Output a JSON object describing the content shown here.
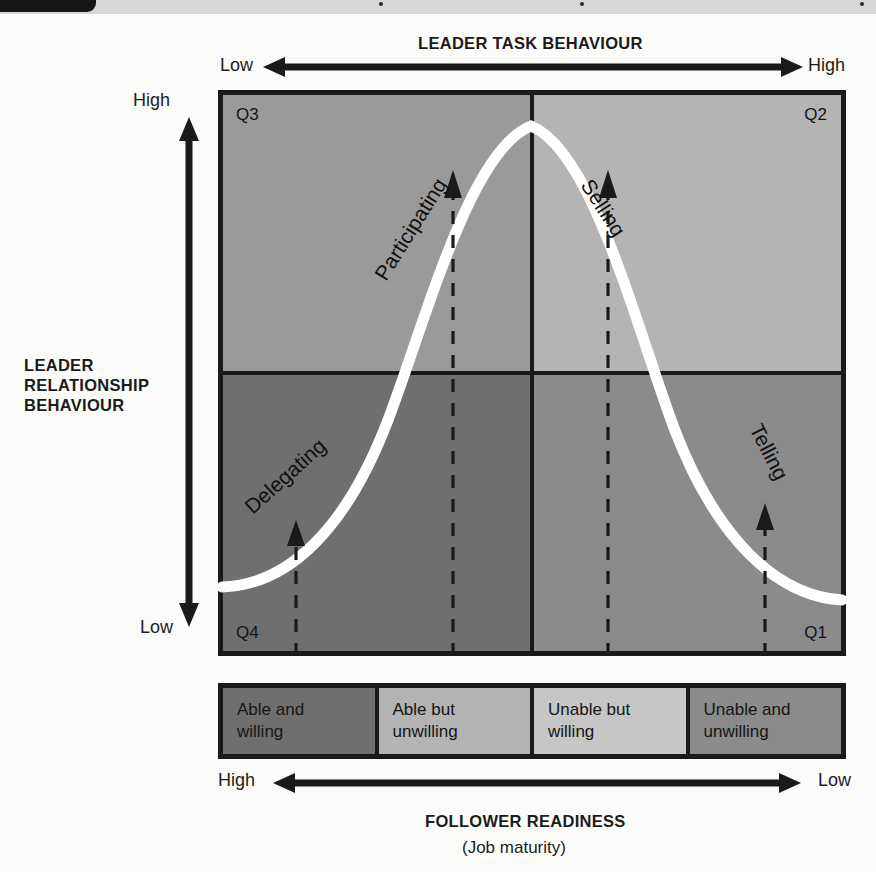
{
  "diagram": {
    "top_axis": {
      "title": "LEADER TASK BEHAVIOUR",
      "left_label": "Low",
      "right_label": "High"
    },
    "left_axis": {
      "title_line1": "LEADER",
      "title_line2": "RELATIONSHIP",
      "title_line3": "BEHAVIOUR",
      "top_label": "High",
      "bottom_label": "Low"
    },
    "bottom_axis": {
      "title": "FOLLOWER READINESS",
      "subtitle": "(Job maturity)",
      "left_label": "High",
      "right_label": "Low"
    },
    "quadrants": [
      {
        "id": "Q3",
        "label": "Q3",
        "style": "Participating",
        "color": "#9a9a9a",
        "position": "top-left"
      },
      {
        "id": "Q2",
        "label": "Q2",
        "style": "Selling",
        "color": "#b4b4b4",
        "position": "top-right"
      },
      {
        "id": "Q4",
        "label": "Q4",
        "style": "Delegating",
        "color": "#6f6f6f",
        "position": "bottom-left"
      },
      {
        "id": "Q1",
        "label": "Q1",
        "style": "Telling",
        "color": "#8b8b8b",
        "position": "bottom-right"
      }
    ],
    "readiness_levels": [
      {
        "label": "Able and\nwilling",
        "color": "#6f6f6f"
      },
      {
        "label": "Able but\nunwilling",
        "color": "#b4b4b4"
      },
      {
        "label": "Unable but\nwilling",
        "color": "#c6c6c6"
      },
      {
        "label": "Unable and\nunwilling",
        "color": "#8b8b8b"
      }
    ],
    "curve": {
      "name": "bell-curve",
      "color": "#ffffff"
    },
    "colors": {
      "frame": "#1a1a1a",
      "text": "#1a1a1a",
      "page_background": "#fbfbfa"
    }
  }
}
